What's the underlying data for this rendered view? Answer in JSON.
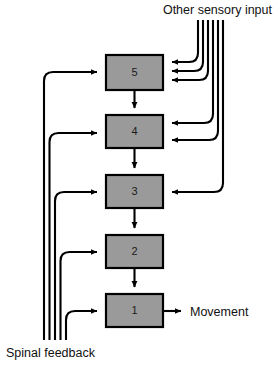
{
  "figure": {
    "type": "block-diagram",
    "background_color": "#ffffff",
    "box_fill_color": "#9a9a9a",
    "line_color": "#000000",
    "text_color": "#111111"
  },
  "labels": {
    "other_sensory_input": "Other sensory input",
    "spinal_feedback": "Spinal feedback",
    "movement": "Movement"
  },
  "boxes": [
    {
      "id": "box-5",
      "label": "5",
      "x": 106,
      "y": 55,
      "w": 57,
      "h": 35
    },
    {
      "id": "box-4",
      "label": "4",
      "x": 106,
      "y": 115,
      "w": 57,
      "h": 33
    },
    {
      "id": "box-3",
      "label": "3",
      "x": 106,
      "y": 175,
      "w": 57,
      "h": 33
    },
    {
      "id": "box-2",
      "label": "2",
      "x": 106,
      "y": 235,
      "w": 57,
      "h": 33
    },
    {
      "id": "box-1",
      "label": "1",
      "x": 106,
      "y": 294,
      "w": 57,
      "h": 33
    }
  ],
  "descending_chain": [
    {
      "from": "box-5",
      "to": "box-4"
    },
    {
      "from": "box-4",
      "to": "box-3"
    },
    {
      "from": "box-3",
      "to": "box-2"
    },
    {
      "from": "box-2",
      "to": "box-1"
    }
  ],
  "sensory_bundle": {
    "name": "other-sensory-input-bundle",
    "line_count": 6,
    "targets": [
      {
        "to": "box-5",
        "arrow_y": 62
      },
      {
        "to": "box-5",
        "arrow_y": 71
      },
      {
        "to": "box-5",
        "arrow_y": 80
      },
      {
        "to": "box-4",
        "arrow_y": 123
      },
      {
        "to": "box-4",
        "arrow_y": 140
      },
      {
        "to": "box-3",
        "arrow_y": 192
      }
    ]
  },
  "feedback_bundle": {
    "name": "spinal-feedback-bundle",
    "line_count": 5,
    "targets": [
      {
        "to": "box-5",
        "arrow_y": 72
      },
      {
        "to": "box-4",
        "arrow_y": 133
      },
      {
        "to": "box-3",
        "arrow_y": 192
      },
      {
        "to": "box-2",
        "arrow_y": 252
      },
      {
        "to": "box-1",
        "arrow_y": 311
      }
    ]
  },
  "output": {
    "from": "box-1",
    "label": "Movement",
    "arrow_from_x": 163,
    "arrow_to_x": 188,
    "arrow_y": 311
  }
}
